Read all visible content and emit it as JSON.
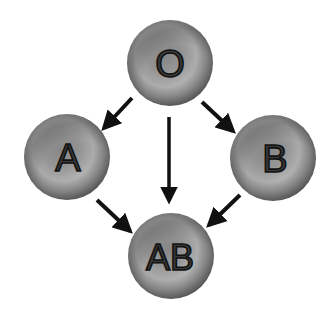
{
  "diagram": {
    "type": "blood-type-compatibility",
    "nodes": [
      {
        "id": "O",
        "label": "O",
        "cx": 170,
        "cy": 63,
        "r": 43
      },
      {
        "id": "A",
        "label": "A",
        "cx": 67,
        "cy": 157,
        "r": 43
      },
      {
        "id": "B",
        "label": "B",
        "cx": 273,
        "cy": 158,
        "r": 43
      },
      {
        "id": "AB",
        "label": "AB",
        "cx": 171,
        "cy": 256,
        "r": 43
      }
    ],
    "edges": [
      {
        "from": "O",
        "to": "A"
      },
      {
        "from": "O",
        "to": "AB"
      },
      {
        "from": "O",
        "to": "B"
      },
      {
        "from": "A",
        "to": "AB"
      },
      {
        "from": "B",
        "to": "AB"
      }
    ],
    "colors": {
      "cell_light": "#b4b4b4",
      "cell_mid": "#8a8a8a",
      "cell_dark": "#5a5a5a",
      "arrow": "#111111"
    }
  }
}
